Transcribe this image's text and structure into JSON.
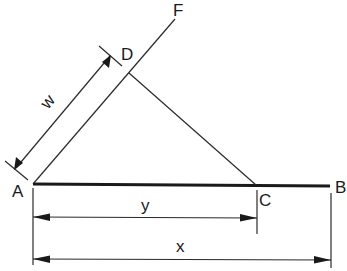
{
  "diagram": {
    "title": "",
    "points": {
      "A": {
        "label": "A"
      },
      "B": {
        "label": "B"
      },
      "C": {
        "label": "C"
      },
      "D": {
        "label": "D"
      },
      "F": {
        "label": "F"
      }
    },
    "dimensions": {
      "w": {
        "label": "w",
        "from": "A",
        "to": "D"
      },
      "y": {
        "label": "y",
        "from": "A",
        "to": "C"
      },
      "x": {
        "label": "x",
        "from": "A",
        "to": "B"
      }
    },
    "segments": [
      "AB",
      "AF",
      "DC"
    ],
    "colors": {
      "line": "#1a1a1a",
      "background": "#ffffff"
    }
  }
}
